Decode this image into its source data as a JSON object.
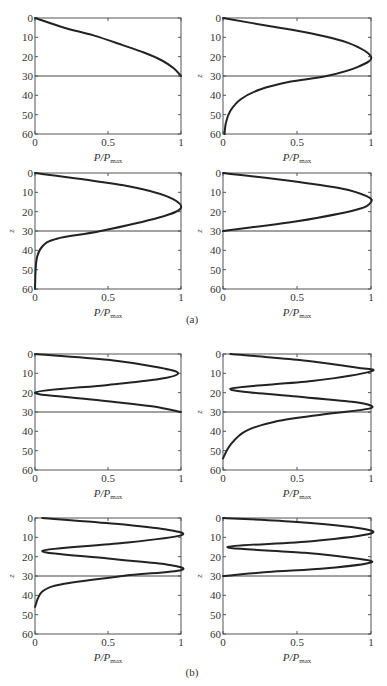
{
  "figure": {
    "groups": [
      {
        "label": "(a)",
        "label_pos": [
          192,
          323
        ]
      },
      {
        "label": "(b)",
        "label_pos": [
          192,
          676
        ]
      }
    ]
  },
  "axis_common": {
    "xlabel_main": "P/P",
    "xlabel_sub": "max",
    "ylabel": "z",
    "xticks": [
      "0",
      "0.5",
      "1"
    ],
    "yticks": [
      "0",
      "10",
      "20",
      "30",
      "40",
      "50",
      "60"
    ],
    "xlim": [
      0,
      1
    ],
    "ylim": [
      0,
      60
    ],
    "hline_z": 30
  },
  "chart_data": [
    {
      "type": "line",
      "panel": "a-1",
      "ylabel_shown": false,
      "xlabel": "P/Pmax",
      "ylabel": "z",
      "xlim": [
        0,
        1
      ],
      "ylim": [
        60,
        0
      ],
      "hline": 30,
      "x": [
        0,
        0.2,
        0.4,
        0.6,
        0.75,
        0.87,
        0.95,
        1.0
      ],
      "z": [
        0,
        5,
        9,
        14,
        18,
        22,
        26,
        30
      ]
    },
    {
      "type": "line",
      "panel": "a-2",
      "ylabel_shown": true,
      "xlabel": "P/Pmax",
      "ylabel": "z",
      "xlim": [
        0,
        1
      ],
      "ylim": [
        60,
        0
      ],
      "hline": 30,
      "x": [
        0,
        0.3,
        0.6,
        0.85,
        1.0,
        0.92,
        0.7,
        0.45,
        0.25,
        0.12,
        0.05,
        0.02,
        0.01
      ],
      "z": [
        0,
        4,
        8,
        13,
        20,
        25,
        30,
        33,
        37,
        42,
        48,
        54,
        60
      ]
    },
    {
      "type": "line",
      "panel": "a-3",
      "ylabel_shown": true,
      "xlabel": "P/Pmax",
      "ylabel": "z",
      "xlim": [
        0,
        1
      ],
      "ylim": [
        60,
        0
      ],
      "hline": 30,
      "x": [
        0,
        0.3,
        0.65,
        0.9,
        1.0,
        0.85,
        0.45,
        0.15,
        0.05,
        0.01,
        0.0
      ],
      "z": [
        0,
        3,
        7,
        12,
        18,
        23,
        30,
        34,
        38,
        45,
        60
      ]
    },
    {
      "type": "line",
      "panel": "a-4",
      "ylabel_shown": true,
      "xlabel": "P/Pmax",
      "ylabel": "z",
      "xlim": [
        0,
        1
      ],
      "ylim": [
        60,
        0
      ],
      "hline": 30,
      "x": [
        0,
        0.45,
        0.8,
        0.97,
        1.0,
        0.9,
        0.5,
        0.2,
        0
      ],
      "z": [
        0,
        4,
        8,
        12,
        15,
        19,
        25,
        28,
        30
      ]
    },
    {
      "type": "line",
      "panel": "b-1",
      "ylabel_shown": false,
      "xlabel": "P/Pmax",
      "ylabel": "z",
      "xlim": [
        0,
        1
      ],
      "ylim": [
        60,
        0
      ],
      "hline": 30,
      "x": [
        0,
        0.5,
        0.85,
        0.98,
        0.85,
        0.5,
        0,
        0.45,
        0.8,
        1.0
      ],
      "z": [
        0,
        3,
        7,
        10,
        13,
        16,
        20,
        24,
        27,
        30
      ]
    },
    {
      "type": "line",
      "panel": "b-2",
      "ylabel_shown": true,
      "xlabel": "P/Pmax",
      "ylabel": "z",
      "xlim": [
        0,
        1
      ],
      "ylim": [
        60,
        0
      ],
      "hline": 30,
      "x": [
        0.05,
        0.5,
        0.9,
        1.0,
        0.6,
        0.05,
        0.5,
        0.9,
        1.0,
        0.7,
        0.35,
        0.15,
        0.05,
        0.0
      ],
      "z": [
        0,
        3,
        7,
        9,
        14,
        18,
        22,
        25,
        28,
        31,
        35,
        40,
        47,
        54
      ]
    },
    {
      "type": "line",
      "panel": "b-3",
      "ylabel_shown": true,
      "xlabel": "P/Pmax",
      "ylabel": "z",
      "xlim": [
        0,
        1
      ],
      "ylim": [
        60,
        0
      ],
      "hline": 30,
      "x": [
        0.05,
        0.55,
        0.9,
        1.0,
        0.6,
        0.05,
        0.5,
        0.9,
        1.0,
        0.6,
        0.2,
        0.05,
        0.0
      ],
      "z": [
        0,
        3,
        6,
        9,
        13,
        17,
        21,
        24,
        27,
        30,
        34,
        38,
        46
      ]
    },
    {
      "type": "line",
      "panel": "b-4",
      "ylabel_shown": true,
      "xlabel": "P/Pmax",
      "ylabel": "z",
      "xlim": [
        0,
        1
      ],
      "ylim": [
        60,
        0
      ],
      "hline": 30,
      "x": [
        0,
        0.5,
        0.9,
        1.0,
        0.6,
        0.03,
        0.55,
        0.9,
        1.0,
        0.7,
        0.3,
        0
      ],
      "z": [
        0,
        2,
        5,
        8,
        12,
        15,
        18,
        21,
        23,
        26,
        28,
        30
      ]
    }
  ]
}
